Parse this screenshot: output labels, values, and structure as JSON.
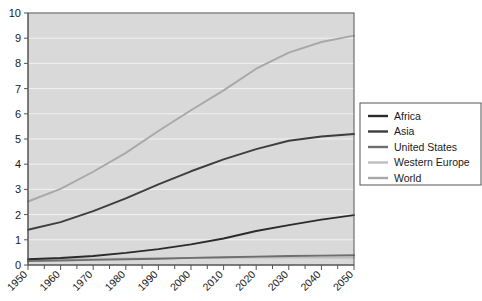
{
  "chart_data": {
    "type": "line",
    "title": "",
    "xlabel": "",
    "ylabel": "",
    "xlim": [
      1950,
      2050
    ],
    "ylim": [
      0,
      10
    ],
    "grid": "horizontal",
    "legend_position": "right",
    "x": [
      1950,
      1960,
      1970,
      1980,
      1990,
      2000,
      2010,
      2020,
      2030,
      2040,
      2050
    ],
    "xticklabels": [
      "1950",
      "1960",
      "1970",
      "1980",
      "1990",
      "2000",
      "2010",
      "2020",
      "2030",
      "2040",
      "2050"
    ],
    "yticklabels": [
      "0",
      "1",
      "2",
      "3",
      "4",
      "5",
      "6",
      "7",
      "8",
      "9",
      "10"
    ],
    "yticks": [
      0,
      1,
      2,
      3,
      4,
      5,
      6,
      7,
      8,
      9,
      10
    ],
    "series": [
      {
        "name": "Africa",
        "color": "#2b2b2b",
        "values": [
          0.23,
          0.28,
          0.36,
          0.48,
          0.63,
          0.82,
          1.05,
          1.35,
          1.58,
          1.8,
          1.98
        ]
      },
      {
        "name": "Asia",
        "color": "#3d3d3d",
        "values": [
          1.4,
          1.7,
          2.14,
          2.64,
          3.2,
          3.72,
          4.19,
          4.6,
          4.93,
          5.1,
          5.2
        ]
      },
      {
        "name": "United States",
        "color": "#6e6e6e",
        "values": [
          0.152,
          0.181,
          0.205,
          0.228,
          0.25,
          0.282,
          0.309,
          0.332,
          0.355,
          0.373,
          0.389
        ]
      },
      {
        "name": "Western Europe",
        "color": "#bdbdbd",
        "values": [
          0.22,
          0.24,
          0.25,
          0.26,
          0.27,
          0.28,
          0.29,
          0.295,
          0.297,
          0.295,
          0.29
        ]
      },
      {
        "name": "World",
        "color": "#a8a8a8",
        "values": [
          2.52,
          3.02,
          3.7,
          4.45,
          5.32,
          6.14,
          6.93,
          7.79,
          8.43,
          8.85,
          9.1
        ]
      }
    ]
  },
  "legend": {
    "entries": [
      {
        "label": "Africa"
      },
      {
        "label": "Asia"
      },
      {
        "label": "United States"
      },
      {
        "label": "Western Europe"
      },
      {
        "label": "World"
      }
    ]
  },
  "style": {
    "plot_background": "#d9d9d9",
    "gridline_color": "#f2f2f2",
    "axis_color": "#555555",
    "legend_border": "#555555",
    "legend_background": "#ffffff",
    "page_background": "#ffffff"
  }
}
